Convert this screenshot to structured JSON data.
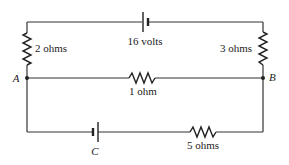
{
  "diagram": {
    "type": "circuit",
    "components": [
      {
        "id": "battery-top",
        "kind": "battery",
        "label": "16 volts"
      },
      {
        "id": "resistor-left",
        "kind": "resistor",
        "label": "2 ohms"
      },
      {
        "id": "resistor-right",
        "kind": "resistor",
        "label": "3 ohms"
      },
      {
        "id": "resistor-middle",
        "kind": "resistor",
        "label": "1 ohm"
      },
      {
        "id": "battery-bottom",
        "kind": "battery",
        "label": "C"
      },
      {
        "id": "resistor-bottom",
        "kind": "resistor",
        "label": "5 ohms"
      }
    ],
    "nodes": [
      {
        "id": "A",
        "label": "A"
      },
      {
        "id": "B",
        "label": "B"
      }
    ]
  }
}
